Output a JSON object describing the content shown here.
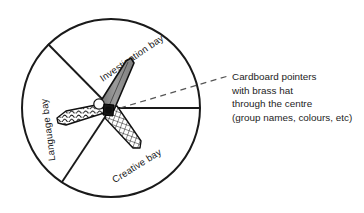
{
  "diagram": {
    "title_text_absent": "",
    "wheel": {
      "name": "segmented-circle-wheel",
      "segments": [
        {
          "id": "investigation",
          "label": "Investigation bay"
        },
        {
          "id": "language",
          "label": "Language bay"
        },
        {
          "id": "creative",
          "label": "Creative bay"
        }
      ],
      "outline_color": "#1a1a1a",
      "divider_color": "#1a1a1a",
      "fill_color": "#ffffff"
    },
    "pointers": [
      {
        "id": "pointer-gray",
        "pattern": "solid-gray",
        "fill_color": "#8c8c8c",
        "stroke_color": "#111111"
      },
      {
        "id": "pointer-wavy",
        "pattern": "wavy-hatch",
        "fill_color": "#ffffff",
        "stroke_color": "#111111"
      },
      {
        "id": "pointer-checkered",
        "pattern": "cross-hatch-grid",
        "fill_color": "#ffffff",
        "stroke_color": "#111111"
      }
    ],
    "hub": {
      "name": "brass-hat-centre-hub",
      "color": "#161616"
    },
    "leader": {
      "name": "dashed-leader-line",
      "style": "dashed",
      "color": "#555555"
    },
    "callout": {
      "lines": [
        "Cardboard pointers",
        "with brass hat",
        "through the centre",
        "(group names, colours, etc)"
      ]
    }
  }
}
